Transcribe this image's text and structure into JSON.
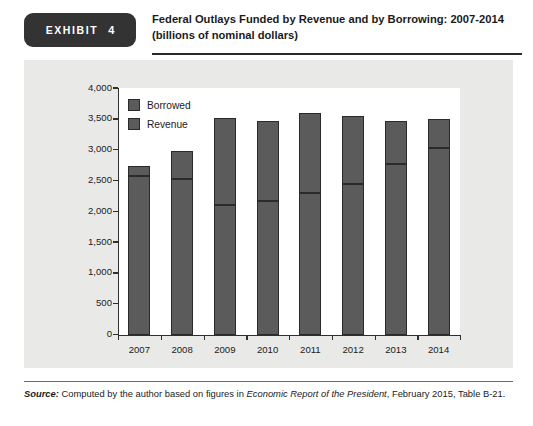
{
  "header": {
    "exhibit_word": "EXHIBIT",
    "exhibit_number": "4",
    "title_line1": "Federal Outlays Funded by Revenue and by Borrowing: 2007-2014",
    "title_line2": "(billions of nominal dollars)"
  },
  "source": {
    "label": "Source:",
    "text_before": " Computed by the author based on figures in ",
    "italic_title": "Economic Report of the President",
    "text_after": ", February 2015, Table B-21."
  },
  "colors": {
    "bar_fill": "#5b5b5b",
    "bar_border": "#2a2a2a",
    "panel_bg": "#e9e9e7",
    "plot_bg": "#ffffff",
    "badge_bg": "#333334",
    "axis": "#2f2f2f"
  },
  "chart_data": {
    "type": "bar",
    "title": "Federal Outlays Funded by Revenue and by Borrowing: 2007-2014",
    "subtitle": "(billions of nominal dollars)",
    "stacked": true,
    "xlabel": "",
    "ylabel": "",
    "ylim": [
      0,
      4000
    ],
    "ytick_step": 500,
    "ytick_labels": [
      "0",
      "500",
      "1,000",
      "1,500",
      "2,000",
      "2,500",
      "3,000",
      "3,500",
      "4,000"
    ],
    "ytick_values": [
      0,
      500,
      1000,
      1500,
      2000,
      2500,
      3000,
      3500,
      4000
    ],
    "grid": false,
    "legend_position": "top-left",
    "categories": [
      "2007",
      "2008",
      "2009",
      "2010",
      "2011",
      "2012",
      "2013",
      "2014"
    ],
    "series": [
      {
        "name": "Revenue",
        "values": [
          2570,
          2520,
          2100,
          2160,
          2300,
          2450,
          2775,
          3020
        ]
      },
      {
        "name": "Borrowed",
        "values": [
          160,
          460,
          1420,
          1300,
          1300,
          1090,
          685,
          480
        ]
      }
    ],
    "totals": [
      2730,
      2980,
      3520,
      3460,
      3600,
      3540,
      3460,
      3500
    ]
  }
}
